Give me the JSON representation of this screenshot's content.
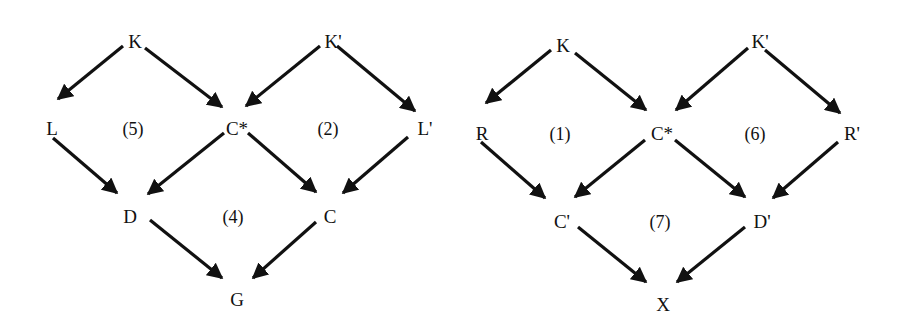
{
  "diagrams": [
    {
      "name": "left-diagram",
      "nodes": [
        {
          "id": "K",
          "label": "K",
          "x": 135,
          "y": 44
        },
        {
          "id": "Kp",
          "label": "K'",
          "x": 333,
          "y": 44
        },
        {
          "id": "L",
          "label": "L",
          "x": 52,
          "y": 131
        },
        {
          "id": "Cs",
          "label": "C*",
          "x": 237,
          "y": 131
        },
        {
          "id": "Lp",
          "label": "L'",
          "x": 425,
          "y": 131
        },
        {
          "id": "D",
          "label": "D",
          "x": 130,
          "y": 219
        },
        {
          "id": "C",
          "label": "C",
          "x": 330,
          "y": 219
        },
        {
          "id": "G",
          "label": "G",
          "x": 237,
          "y": 302
        }
      ],
      "regions": [
        {
          "label": "(5)",
          "x": 133,
          "y": 131
        },
        {
          "label": "(2)",
          "x": 328,
          "y": 131
        },
        {
          "label": "(4)",
          "x": 233,
          "y": 219
        }
      ],
      "edges": [
        {
          "from": "K",
          "to": "L",
          "x1": 123,
          "y1": 46,
          "x2": 58,
          "y2": 99
        },
        {
          "from": "K",
          "to": "Cs",
          "x1": 145,
          "y1": 48,
          "x2": 222,
          "y2": 107
        },
        {
          "from": "Kp",
          "to": "Cs",
          "x1": 320,
          "y1": 46,
          "x2": 246,
          "y2": 106
        },
        {
          "from": "Kp",
          "to": "Lp",
          "x1": 337,
          "y1": 46,
          "x2": 415,
          "y2": 111
        },
        {
          "from": "L",
          "to": "D",
          "x1": 53,
          "y1": 138,
          "x2": 117,
          "y2": 193
        },
        {
          "from": "Cs",
          "to": "D",
          "x1": 224,
          "y1": 133,
          "x2": 148,
          "y2": 194
        },
        {
          "from": "Cs",
          "to": "C",
          "x1": 248,
          "y1": 133,
          "x2": 316,
          "y2": 192
        },
        {
          "from": "Lp",
          "to": "C",
          "x1": 408,
          "y1": 137,
          "x2": 343,
          "y2": 193
        },
        {
          "from": "D",
          "to": "G",
          "x1": 150,
          "y1": 220,
          "x2": 222,
          "y2": 278
        },
        {
          "from": "C",
          "to": "G",
          "x1": 316,
          "y1": 222,
          "x2": 253,
          "y2": 278
        }
      ]
    },
    {
      "name": "right-diagram",
      "nodes": [
        {
          "id": "K",
          "label": "K",
          "x": 563,
          "y": 48
        },
        {
          "id": "Kp",
          "label": "K'",
          "x": 760,
          "y": 44
        },
        {
          "id": "R",
          "label": "R",
          "x": 482,
          "y": 136
        },
        {
          "id": "Cs",
          "label": "C*",
          "x": 662,
          "y": 136
        },
        {
          "id": "Rp",
          "label": "R'",
          "x": 852,
          "y": 136
        },
        {
          "id": "Cp",
          "label": "C'",
          "x": 562,
          "y": 224
        },
        {
          "id": "Dp",
          "label": "D'",
          "x": 762,
          "y": 224
        },
        {
          "id": "X",
          "label": "X",
          "x": 663,
          "y": 307
        }
      ],
      "regions": [
        {
          "label": "(1)",
          "x": 560,
          "y": 136
        },
        {
          "label": "(6)",
          "x": 755,
          "y": 136
        },
        {
          "label": "(7)",
          "x": 660,
          "y": 224
        }
      ],
      "edges": [
        {
          "from": "K",
          "to": "R",
          "x1": 551,
          "y1": 50,
          "x2": 486,
          "y2": 103
        },
        {
          "from": "K",
          "to": "Cs",
          "x1": 575,
          "y1": 53,
          "x2": 646,
          "y2": 110
        },
        {
          "from": "Kp",
          "to": "Cs",
          "x1": 748,
          "y1": 48,
          "x2": 676,
          "y2": 110
        },
        {
          "from": "Kp",
          "to": "Rp",
          "x1": 765,
          "y1": 50,
          "x2": 840,
          "y2": 113
        },
        {
          "from": "R",
          "to": "Cp",
          "x1": 481,
          "y1": 142,
          "x2": 545,
          "y2": 198
        },
        {
          "from": "Cs",
          "to": "Cp",
          "x1": 645,
          "y1": 140,
          "x2": 575,
          "y2": 197
        },
        {
          "from": "Cs",
          "to": "Dp",
          "x1": 675,
          "y1": 140,
          "x2": 745,
          "y2": 197
        },
        {
          "from": "Rp",
          "to": "Dp",
          "x1": 838,
          "y1": 142,
          "x2": 773,
          "y2": 198
        },
        {
          "from": "Cp",
          "to": "X",
          "x1": 578,
          "y1": 227,
          "x2": 646,
          "y2": 282
        },
        {
          "from": "Dp",
          "to": "X",
          "x1": 745,
          "y1": 227,
          "x2": 677,
          "y2": 282
        }
      ]
    }
  ]
}
